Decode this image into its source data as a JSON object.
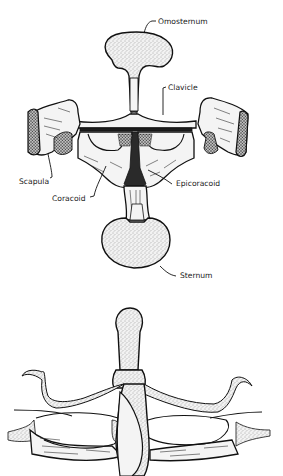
{
  "figure": {
    "top_diagram": {
      "description": "Pectoral girdle, ventral view (firmisternal)",
      "labels": {
        "omosternum": "Omosternum",
        "clavicle": "Clavicle",
        "scapula": "Scapula",
        "coracoid": "Coracoid",
        "epicoracoid": "Epicoracoid",
        "sternum": "Sternum"
      }
    },
    "bottom_diagram": {
      "description": "Pectoral girdle, ventral view (arciferal), unlabeled"
    },
    "colors": {
      "ink": "#111111",
      "bone_fill": "#f4f4f4",
      "background": "#ffffff"
    }
  }
}
